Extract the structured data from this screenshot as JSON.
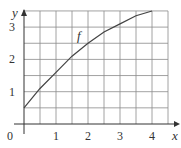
{
  "chart_data": {
    "type": "line",
    "title": "",
    "xlabel": "x",
    "ylabel": "y",
    "xlim": [
      0,
      4.5
    ],
    "ylim": [
      0,
      3.5
    ],
    "grid": true,
    "grid_step": 0.5,
    "x_ticks": [
      "0",
      "1",
      "2",
      "3",
      "4"
    ],
    "y_ticks": [
      "1",
      "2",
      "3"
    ],
    "series": [
      {
        "name": "f",
        "x": [
          0,
          0.5,
          1,
          1.5,
          2,
          2.5,
          3,
          3.5,
          4
        ],
        "y": [
          0.5,
          1.1,
          1.6,
          2.1,
          2.5,
          2.85,
          3.1,
          3.35,
          3.5
        ]
      }
    ],
    "annotations": [
      {
        "text": "f",
        "x": 1.6,
        "y": 2.6
      }
    ]
  }
}
